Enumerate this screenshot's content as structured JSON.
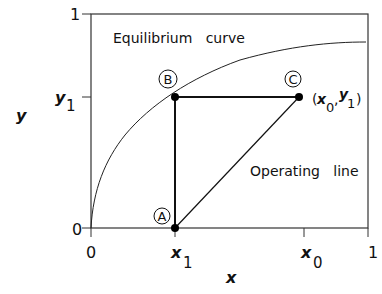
{
  "diagram": {
    "title": "",
    "axes": {
      "x_label": "x",
      "y_label": "y",
      "x_ticks": [
        {
          "label": "0",
          "sub": ""
        },
        {
          "label": "x",
          "sub": "1"
        },
        {
          "label": "x",
          "sub": "0"
        },
        {
          "label": "1",
          "sub": ""
        }
      ],
      "y_ticks": [
        {
          "label": "0",
          "sub": ""
        },
        {
          "label": "y",
          "sub": "1"
        },
        {
          "label": "1",
          "sub": ""
        }
      ]
    },
    "curves": {
      "equilibrium_label": "Equilibrium   curve",
      "operating_label": "Operating   line"
    },
    "points": {
      "A": {
        "label": "A"
      },
      "B": {
        "label": "B"
      },
      "C": {
        "label": "C",
        "coord_text_open": "(",
        "coord_x": "x",
        "coord_x_sub": "0",
        "coord_comma": ",",
        "coord_y": "y",
        "coord_y_sub": "1",
        "coord_text_close": ")"
      }
    },
    "colors": {
      "line": "#111111",
      "frame": "#333333",
      "background": "#ffffff"
    }
  }
}
